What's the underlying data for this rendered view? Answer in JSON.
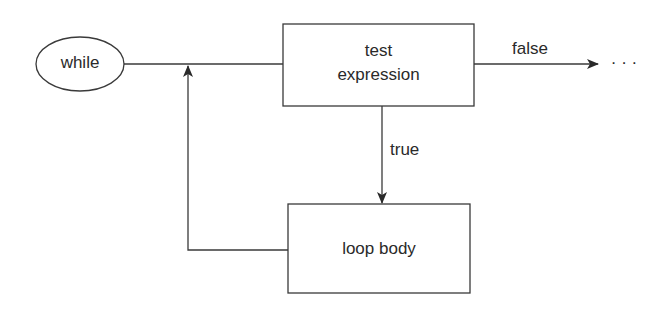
{
  "diagram": {
    "type": "flowchart",
    "start": {
      "label": "while"
    },
    "test": {
      "line1": "test",
      "line2": "expression"
    },
    "body": {
      "label": "loop body"
    },
    "edges": {
      "false_label": "false",
      "true_label": "true",
      "continuation": "· · ·"
    }
  }
}
